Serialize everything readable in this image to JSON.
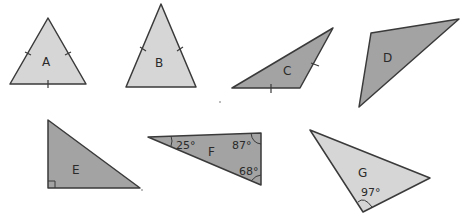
{
  "diagram": {
    "title": "",
    "colors": {
      "light": "#d6d6d6",
      "dark": "#a3a3a3",
      "stroke": "#3a3a3a"
    },
    "triangles": [
      {
        "label": "A",
        "shade": "light",
        "equal_side_marks": 3,
        "angles": []
      },
      {
        "label": "B",
        "shade": "light",
        "equal_side_marks": 2,
        "angles": []
      },
      {
        "label": "C",
        "shade": "dark",
        "equal_side_marks": 2,
        "angles": []
      },
      {
        "label": "D",
        "shade": "dark",
        "equal_side_marks": 0,
        "angles": []
      },
      {
        "label": "E",
        "shade": "dark",
        "equal_side_marks": 0,
        "right_angle": true,
        "angles": []
      },
      {
        "label": "F",
        "shade": "dark",
        "equal_side_marks": 0,
        "angles": [
          "25°",
          "87°",
          "68°"
        ]
      },
      {
        "label": "G",
        "shade": "light",
        "equal_side_marks": 0,
        "angles": [
          "97°"
        ]
      }
    ]
  }
}
